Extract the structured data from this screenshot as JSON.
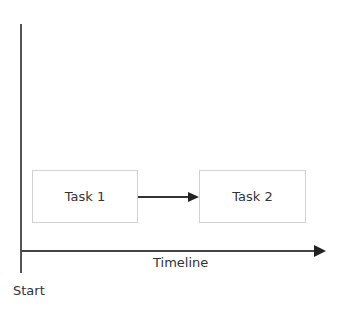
{
  "diagram": {
    "tasks": [
      {
        "label": "Task 1"
      },
      {
        "label": "Task 2"
      }
    ],
    "axis": {
      "x_label": "Timeline",
      "origin_label": "Start"
    },
    "colors": {
      "axis": "#555555",
      "arrow": "#222222",
      "box_border": "#d2d2d2",
      "text": "#333333"
    }
  }
}
